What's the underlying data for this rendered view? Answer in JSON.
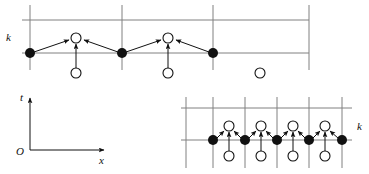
{
  "figure": {
    "title": "",
    "background_color": "#ffffff",
    "ink_color": "#111111",
    "grid_color": "#808080",
    "labels": {
      "lattice_k_top": "k",
      "lattice_k_bottom": "k",
      "axis_t": "t",
      "axis_x": "x",
      "axis_origin": "O"
    },
    "panels": [
      {
        "name": "top-lattice-panel",
        "grid": {
          "vertical_lines_x": [
            30,
            122,
            213,
            309
          ],
          "horizontal_lines_y": [
            20,
            53
          ],
          "vertical_extent": [
            5,
            70
          ],
          "horizontal_extent": [
            22,
            309
          ]
        },
        "filled_nodes": [
          {
            "x": 30,
            "y": 53
          },
          {
            "x": 122,
            "y": 53
          },
          {
            "x": 213,
            "y": 53
          }
        ],
        "open_nodes_upper": [
          {
            "x": 76,
            "y": 38
          },
          {
            "x": 168,
            "y": 38
          }
        ],
        "open_nodes_lower": [
          {
            "x": 76,
            "y": 73
          },
          {
            "x": 168,
            "y": 73
          },
          {
            "x": 260,
            "y": 73
          }
        ],
        "arrows": [
          {
            "from": [
              30,
              53
            ],
            "to": [
              76,
              38
            ],
            "kind": "diagonal-up-right"
          },
          {
            "from": [
              122,
              53
            ],
            "to": [
              76,
              38
            ],
            "kind": "diagonal-up-left"
          },
          {
            "from": [
              76,
              73
            ],
            "to": [
              76,
              38
            ],
            "kind": "vertical-up"
          },
          {
            "from": [
              122,
              53
            ],
            "to": [
              168,
              38
            ],
            "kind": "diagonal-up-right"
          },
          {
            "from": [
              213,
              53
            ],
            "to": [
              168,
              38
            ],
            "kind": "diagonal-up-left"
          },
          {
            "from": [
              168,
              73
            ],
            "to": [
              168,
              38
            ],
            "kind": "vertical-up"
          }
        ],
        "label_k": {
          "x": 8,
          "y": 41
        }
      },
      {
        "name": "bottom-right-lattice-panel",
        "grid": {
          "vertical_lines_x": [
            186,
            213,
            245,
            277,
            309,
            342
          ],
          "horizontal_lines_y": [
            108,
            140
          ],
          "vertical_extent": [
            97,
            168
          ],
          "horizontal_extent": [
            181,
            352
          ]
        },
        "filled_nodes": [
          {
            "x": 213,
            "y": 140
          },
          {
            "x": 245,
            "y": 140
          },
          {
            "x": 277,
            "y": 140
          },
          {
            "x": 309,
            "y": 140
          },
          {
            "x": 342,
            "y": 140
          }
        ],
        "open_nodes_upper": [
          {
            "x": 229,
            "y": 126
          },
          {
            "x": 261,
            "y": 126
          },
          {
            "x": 293,
            "y": 126
          },
          {
            "x": 325,
            "y": 126
          }
        ],
        "open_nodes_lower": [
          {
            "x": 229,
            "y": 156
          },
          {
            "x": 261,
            "y": 156
          },
          {
            "x": 293,
            "y": 156
          },
          {
            "x": 325,
            "y": 156
          }
        ],
        "arrow_groups": [
          {
            "left_node": [
              213,
              140
            ],
            "right_node": [
              245,
              140
            ],
            "target": [
              229,
              126
            ],
            "below": [
              229,
              156
            ]
          },
          {
            "left_node": [
              245,
              140
            ],
            "right_node": [
              277,
              140
            ],
            "target": [
              261,
              126
            ],
            "below": [
              261,
              156
            ]
          },
          {
            "left_node": [
              277,
              140
            ],
            "right_node": [
              309,
              140
            ],
            "target": [
              293,
              126
            ],
            "below": [
              293,
              156
            ]
          },
          {
            "left_node": [
              309,
              140
            ],
            "right_node": [
              342,
              140
            ],
            "target": [
              325,
              126
            ],
            "below": [
              325,
              156
            ]
          }
        ],
        "label_k": {
          "x": 358,
          "y": 129
        }
      },
      {
        "name": "bottom-left-axes-panel",
        "origin": {
          "x": 30,
          "y": 150
        },
        "t_axis": {
          "from": [
            30,
            150
          ],
          "to": [
            30,
            97
          ]
        },
        "x_axis": {
          "from": [
            30,
            150
          ],
          "to": [
            105,
            150
          ]
        },
        "label_t": {
          "x": 22,
          "y": 99
        },
        "label_x": {
          "x": 101,
          "y": 163
        },
        "label_O": {
          "x": 19,
          "y": 153
        }
      }
    ]
  }
}
